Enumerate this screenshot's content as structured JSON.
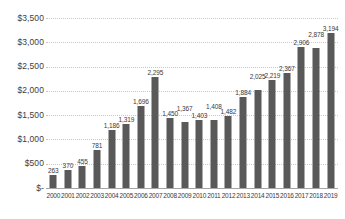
{
  "chart_data": {
    "type": "bar",
    "title": "",
    "xlabel": "",
    "ylabel": "",
    "ylim": [
      0,
      3500
    ],
    "grid": true,
    "legend": false,
    "legend_position": "none",
    "bar_color": "#595959",
    "gridline_color": "#c8c8c8",
    "axis_color": "#a6a6a6",
    "categories": [
      "2000",
      "2001",
      "2002",
      "2003",
      "2004",
      "2005",
      "2006",
      "2007",
      "2008",
      "2009",
      "2010",
      "2011",
      "2012",
      "2013",
      "2014",
      "2015",
      "2016",
      "2017",
      "2018",
      "2019"
    ],
    "values": [
      263,
      370,
      455,
      781,
      1186,
      1319,
      1696,
      2295,
      1450,
      1367,
      1403,
      1408,
      1482,
      1884,
      2025,
      2219,
      2367,
      2906,
      2878,
      3194
    ],
    "data_labels": [
      "263",
      "370",
      "455",
      "781",
      "1,186",
      "1,319",
      "1,696",
      "2,295",
      "1,450",
      "1,367",
      "1,403",
      "1,408",
      "1,482",
      "1,884",
      "2,025",
      "2,219",
      "2,367",
      "2,906",
      "2,878",
      "3,194"
    ],
    "label_offsets": [
      0,
      0,
      0,
      0,
      0,
      0,
      0,
      0,
      0,
      9,
      0,
      9,
      0,
      0,
      9,
      0,
      0,
      0,
      9,
      0
    ],
    "yticks": [
      0,
      500,
      1000,
      1500,
      2000,
      2500,
      3000,
      3500
    ],
    "ytick_labels": [
      "$-",
      "$500",
      "$1,000",
      "$1,500",
      "$2,000",
      "$2,500",
      "$3,000",
      "$3,500"
    ]
  }
}
